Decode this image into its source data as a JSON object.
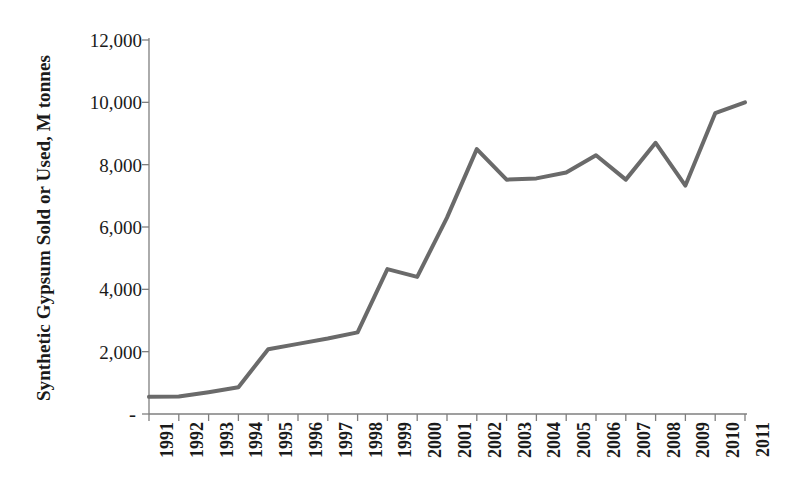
{
  "chart_data": {
    "type": "line",
    "title": "",
    "xlabel": "",
    "ylabel": "Synthetic Gypsum Sold or Used, M tonnes",
    "categories": [
      "1991",
      "1992",
      "1993",
      "1994",
      "1995",
      "1996",
      "1997",
      "1998",
      "1999",
      "2000",
      "2001",
      "2002",
      "2003",
      "2004",
      "2005",
      "2006",
      "2007",
      "2008",
      "2009",
      "2010",
      "2011"
    ],
    "values": [
      550,
      560,
      700,
      860,
      2080,
      2250,
      2420,
      2620,
      4650,
      4400,
      6300,
      8500,
      7520,
      7560,
      7750,
      8300,
      7520,
      8700,
      7330,
      9650,
      10000
    ],
    "ylim": [
      0,
      12000
    ],
    "ytick_labels": [
      "-",
      "2,000",
      "4,000",
      "6,000",
      "8,000",
      "10,000",
      "12,000"
    ],
    "ytick_values": [
      0,
      2000,
      4000,
      6000,
      8000,
      10000,
      12000
    ],
    "grid": false,
    "legend": null,
    "series_color": "#6a6a6a",
    "axis_color": "#7f7f7f",
    "line_width": 4
  }
}
